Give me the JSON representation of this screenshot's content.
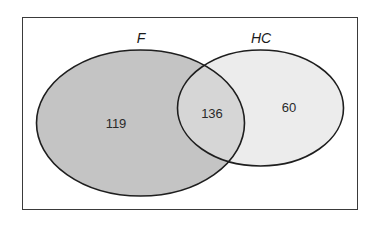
{
  "diagram": {
    "type": "venn",
    "sets": [
      {
        "id": "F",
        "label": "F",
        "only_count": "119",
        "fill": "#c4c4c4"
      },
      {
        "id": "HC",
        "label": "HC",
        "only_count": "60",
        "fill": "#ececec"
      }
    ],
    "intersection": {
      "sets": [
        "F",
        "HC"
      ],
      "count": "136",
      "fill": "#d6d6d6"
    },
    "stroke_color": "#1e1e1e",
    "frame_color": "#3a3a3a",
    "background": "#ffffff"
  }
}
